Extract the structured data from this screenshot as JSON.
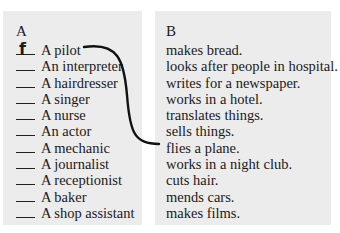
{
  "column_a": {
    "heading": "A",
    "items": [
      {
        "answer": "f",
        "label": "A pilot"
      },
      {
        "answer": "",
        "label": "An interpreter"
      },
      {
        "answer": "",
        "label": "A hairdresser"
      },
      {
        "answer": "",
        "label": "A singer"
      },
      {
        "answer": "",
        "label": "A nurse"
      },
      {
        "answer": "",
        "label": "An actor"
      },
      {
        "answer": "",
        "label": "A mechanic"
      },
      {
        "answer": "",
        "label": "A journalist"
      },
      {
        "answer": "",
        "label": "A receptionist"
      },
      {
        "answer": "",
        "label": "A baker"
      },
      {
        "answer": "",
        "label": "A shop assistant"
      }
    ]
  },
  "column_b": {
    "heading": "B",
    "items": [
      "makes bread.",
      "looks after people in hospital.",
      "writes for a newspaper.",
      "works in a hotel.",
      "translates things.",
      "sells things.",
      "flies a plane.",
      "works in a night club.",
      "cuts hair.",
      "mends cars.",
      "makes films."
    ]
  },
  "example_match": {
    "from": "A pilot",
    "to": "flies a plane."
  },
  "colors": {
    "panel_bg": "#ececec",
    "text": "#1a1a1a",
    "line": "#111111"
  }
}
